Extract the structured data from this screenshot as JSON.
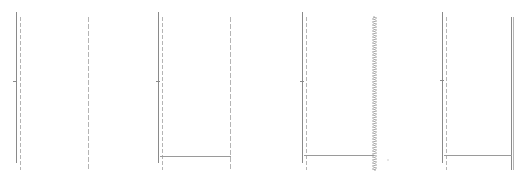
{
  "canvas": {
    "width": 527,
    "height": 178,
    "background": "#ffffff"
  },
  "colors": {
    "solid": "#8a8a8a",
    "dashed": "#b4b4b4",
    "base": "#9a9a9a",
    "hatched": "#a8a8a8",
    "dot": "#c8c8c8"
  },
  "panels": [
    {
      "name": "panel-1",
      "left_solid": {
        "x": 16,
        "y1": 12,
        "y2": 163
      },
      "left_dashed": {
        "x": 20,
        "y1": 17,
        "y2": 170
      },
      "left_tick": {
        "x": 14,
        "y": 81
      },
      "right": {
        "x": 88,
        "y1": 17,
        "y2": 170,
        "style": "dashed"
      },
      "base": null
    },
    {
      "name": "panel-2",
      "left_solid": {
        "x": 158,
        "y1": 12,
        "y2": 163
      },
      "left_dashed": {
        "x": 162,
        "y1": 17,
        "y2": 170
      },
      "left_tick": {
        "x": 157,
        "y": 81
      },
      "right": {
        "x": 230,
        "y1": 17,
        "y2": 170,
        "style": "dashed"
      },
      "base": {
        "y": 156,
        "x1": 160,
        "x2": 231
      }
    },
    {
      "name": "panel-3",
      "left_solid": {
        "x": 302,
        "y1": 12,
        "y2": 163
      },
      "left_dashed": {
        "x": 306,
        "y1": 17,
        "y2": 170
      },
      "left_tick": {
        "x": 301,
        "y": 81
      },
      "right": {
        "x": 373,
        "y1": 17,
        "y2": 170,
        "style": "hatched"
      },
      "base": {
        "y": 155,
        "x1": 304,
        "x2": 374
      },
      "stray_dot": {
        "x": 388,
        "y": 160
      }
    },
    {
      "name": "panel-4",
      "left_solid": {
        "x": 442,
        "y1": 12,
        "y2": 163
      },
      "left_dashed": {
        "x": 446,
        "y1": 17,
        "y2": 170
      },
      "left_tick": {
        "x": 441,
        "y": 80
      },
      "right": {
        "x": 512,
        "y1": 17,
        "y2": 170,
        "style": "double"
      },
      "base": {
        "y": 155,
        "x1": 444,
        "x2": 512
      }
    }
  ]
}
